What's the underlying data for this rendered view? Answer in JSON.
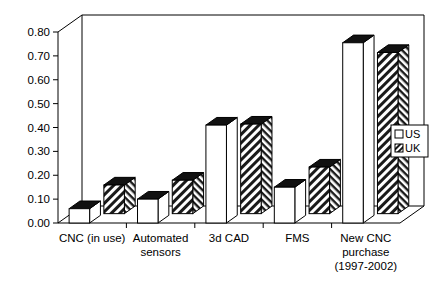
{
  "chart_data": {
    "type": "bar",
    "title": "",
    "subtitle": "",
    "xlabel": "",
    "ylabel": "",
    "ylim": [
      0.0,
      0.8
    ],
    "ytick_labels": [
      "0.00",
      "0.10",
      "0.20",
      "0.30",
      "0.40",
      "0.50",
      "0.60",
      "0.70",
      "0.80"
    ],
    "ytick_values": [
      0.0,
      0.1,
      0.2,
      0.3,
      0.4,
      0.5,
      0.6,
      0.7,
      0.8
    ],
    "grid": false,
    "three_d": true,
    "legend_position": "right",
    "categories": [
      "CNC (in use)",
      "Automated sensors",
      "3d CAD",
      "FMS",
      "New CNC purchase (1997-2002)"
    ],
    "category_label_lines": [
      [
        "CNC (in use)"
      ],
      [
        "Automated",
        "sensors"
      ],
      [
        "3d CAD"
      ],
      [
        "FMS"
      ],
      [
        "New CNC",
        "purchase",
        "(1997-2002)"
      ]
    ],
    "series": [
      {
        "name": "US",
        "fill": "white",
        "values": [
          0.06,
          0.1,
          0.41,
          0.15,
          0.755
        ]
      },
      {
        "name": "UK",
        "fill": "hatched",
        "values": [
          0.12,
          0.14,
          0.375,
          0.195,
          0.675
        ]
      }
    ],
    "colors": {
      "axis": "#000000",
      "bar_outline": "#000000",
      "us_face": "#ffffff",
      "uk_face": "#ffffff",
      "bar_top": "#000000",
      "background": "#ffffff"
    }
  },
  "legend": {
    "entries": [
      {
        "label": "US",
        "swatch": "empty-square"
      },
      {
        "label": "UK",
        "swatch": "hatched-square"
      }
    ]
  }
}
